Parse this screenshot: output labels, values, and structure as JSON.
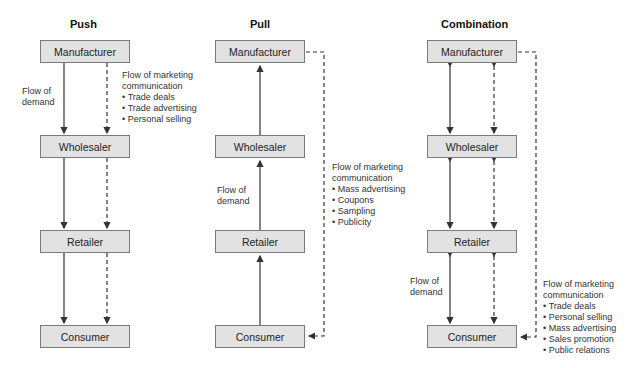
{
  "panels": {
    "push": {
      "title": "Push",
      "boxes": [
        "Manufacturer",
        "Wholesaler",
        "Retailer",
        "Consumer"
      ],
      "demand_label": [
        "Flow of",
        "demand"
      ],
      "comm_label": [
        "Flow of marketing",
        "communication"
      ],
      "comm_items": [
        "Trade deals",
        "Trade advertising",
        "Personal selling"
      ]
    },
    "pull": {
      "title": "Pull",
      "boxes": [
        "Manufacturer",
        "Wholesaler",
        "Retailer",
        "Consumer"
      ],
      "demand_label": [
        "Flow of",
        "demand"
      ],
      "comm_label": [
        "Flow of marketing",
        "communication"
      ],
      "comm_items": [
        "Mass advertising",
        "Coupons",
        "Sampling",
        "Publicity"
      ]
    },
    "combination": {
      "title": "Combination",
      "boxes": [
        "Manufacturer",
        "Wholesaler",
        "Retailer",
        "Consumer"
      ],
      "demand_label": [
        "Flow of",
        "demand"
      ],
      "comm_label": [
        "Flow of marketing",
        "communication"
      ],
      "comm_items": [
        "Trade deals",
        "Personal selling",
        "Mass advertising",
        "Sales promotion",
        "Public relations"
      ]
    }
  },
  "colors": {
    "box_fill": "#e2e2e2",
    "box_border": "#7a7a7a",
    "line": "#333333"
  }
}
